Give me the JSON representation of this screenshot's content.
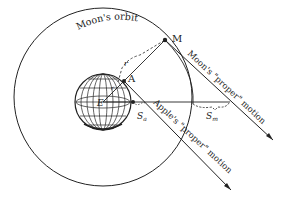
{
  "diagram": {
    "labels": {
      "orbit": "Moon's orbit",
      "moon_point": "M",
      "apple_point": "A",
      "earth_center": "E",
      "radius": "r",
      "radius_small": "r",
      "apple_fall": "Sa",
      "moon_fall": "Sm",
      "moon_motion": "Moon's \"proper\" motion",
      "apple_motion": "Apple's \"proper\" motion"
    },
    "colors": {
      "stroke": "#222222",
      "background": "#ffffff"
    }
  }
}
